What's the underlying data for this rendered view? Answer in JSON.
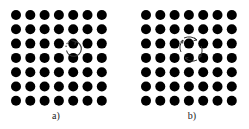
{
  "figure": {
    "panels": [
      {
        "id": "a",
        "caption": "a)",
        "grid": {
          "rows": 7,
          "cols": 7
        },
        "annotation": "single circular arrow around one lattice site (vortex/rotation)",
        "highlight_site": {
          "row": 3,
          "col": 4
        }
      },
      {
        "id": "b",
        "caption": "b)",
        "grid": {
          "rows": 7,
          "cols": 7
        },
        "annotation": "four small arrows circulating around a plaquette between four lattice sites",
        "highlight_plaquette": {
          "rows": [
            2,
            3
          ],
          "cols": [
            3,
            4
          ]
        }
      }
    ],
    "colors": {
      "dot": "#000000",
      "background": "#ffffff",
      "arrow": "#333333"
    }
  }
}
